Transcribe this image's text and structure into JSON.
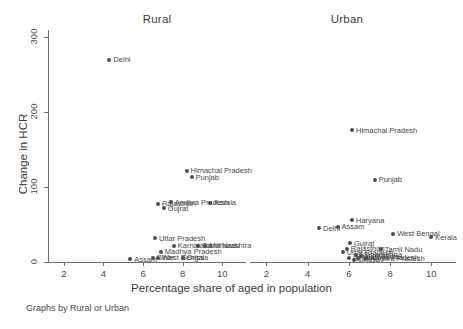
{
  "figure": {
    "footnote": "Graphs by Rural or Urban"
  },
  "axes": {
    "ylabel": "Change in HCR",
    "xlabel": "Percentage share of aged in population",
    "yticks": [
      "0",
      "100",
      "200",
      "300"
    ],
    "xticks": [
      "2",
      "4",
      "6",
      "8",
      "10"
    ],
    "ylim": [
      0,
      310
    ],
    "xlim": [
      1.2,
      11.2
    ],
    "grid": false
  },
  "panels": [
    {
      "id": "rural",
      "title": "Rural"
    },
    {
      "id": "urban",
      "title": "Urban"
    }
  ],
  "chart_data": {
    "type": "scatter",
    "title": "",
    "xlabel": "Percentage share of aged in population",
    "ylabel": "Change in HCR",
    "xlim": [
      1.2,
      11.2
    ],
    "ylim": [
      0,
      310
    ],
    "grid": false,
    "legend": "none",
    "facet_by": "Rural or Urban",
    "footnote": "Graphs by Rural or Urban",
    "panels": [
      {
        "name": "Rural",
        "points": [
          {
            "label": "Delhi",
            "x": 4.3,
            "y": 270
          },
          {
            "label": "Himachal Pradesh",
            "x": 8.2,
            "y": 122
          },
          {
            "label": "Punjab",
            "x": 8.45,
            "y": 113
          },
          {
            "label": "Rajasthan",
            "x": 6.75,
            "y": 78
          },
          {
            "label": "Andhra Pradesh",
            "x": 7.4,
            "y": 80
          },
          {
            "label": "Kerala",
            "x": 9.4,
            "y": 79
          },
          {
            "label": "Gujrat",
            "x": 7.05,
            "y": 72
          },
          {
            "label": "Uttar Pradesh",
            "x": 6.6,
            "y": 32
          },
          {
            "label": "Karnataka",
            "x": 7.55,
            "y": 22
          },
          {
            "label": "Tamil Nadu",
            "x": 8.8,
            "y": 22
          },
          {
            "label": "Maharashtra",
            "x": 9.15,
            "y": 22
          },
          {
            "label": "Madhya Pradesh",
            "x": 6.9,
            "y": 14
          },
          {
            "label": "Bihar",
            "x": 6.5,
            "y": 6
          },
          {
            "label": "West Bengal",
            "x": 6.75,
            "y": 6
          },
          {
            "label": "Orissa",
            "x": 8.0,
            "y": 6
          },
          {
            "label": "Assam",
            "x": 5.35,
            "y": 4
          }
        ]
      },
      {
        "name": "Urban",
        "points": [
          {
            "label": "Himachal Pradesh",
            "x": 6.15,
            "y": 176
          },
          {
            "label": "Punjab",
            "x": 7.25,
            "y": 110
          },
          {
            "label": "Haryana",
            "x": 6.15,
            "y": 56
          },
          {
            "label": "Delhi",
            "x": 4.55,
            "y": 45
          },
          {
            "label": "Assam",
            "x": 5.45,
            "y": 47
          },
          {
            "label": "West Bengal",
            "x": 8.15,
            "y": 38
          },
          {
            "label": "Kerala",
            "x": 10.0,
            "y": 33
          },
          {
            "label": "Gujrat",
            "x": 6.05,
            "y": 25
          },
          {
            "label": "Rajasthan",
            "x": 5.9,
            "y": 18
          },
          {
            "label": "Tamil Nadu",
            "x": 7.55,
            "y": 17
          },
          {
            "label": "Uttar Pradesh",
            "x": 5.7,
            "y": 13
          },
          {
            "label": "Maharashtra",
            "x": 6.35,
            "y": 10
          },
          {
            "label": "Karnataka",
            "x": 6.6,
            "y": 8
          },
          {
            "label": "Madhya Pradesh",
            "x": 6.45,
            "y": 6
          },
          {
            "label": "Bihar",
            "x": 6.0,
            "y": 5
          },
          {
            "label": "Orissa",
            "x": 6.25,
            "y": 3
          },
          {
            "label": "Andhra Pradesh",
            "x": 6.85,
            "y": 5
          }
        ]
      }
    ]
  }
}
